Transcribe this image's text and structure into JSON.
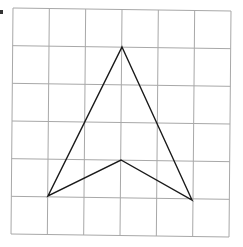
{
  "diagram": {
    "type": "grid-shape",
    "grid": {
      "columns": 6,
      "rows": 6,
      "corners": {
        "top_left": [
          13,
          8
        ],
        "top_right": [
          231,
          11
        ],
        "bottom_left": [
          11,
          234
        ],
        "bottom_right": [
          229,
          237
        ]
      },
      "line_color": "#a8a8a8"
    },
    "shape": {
      "name": "arrowhead",
      "stroke_color": "#1a1a1a",
      "vertices_grid": [
        [
          3,
          1
        ],
        [
          5,
          5
        ],
        [
          3,
          4
        ],
        [
          1,
          5
        ]
      ],
      "vertices_px": [
        [
          122,
          47
        ],
        [
          192,
          200
        ],
        [
          121,
          160
        ],
        [
          48,
          196
        ]
      ]
    }
  }
}
